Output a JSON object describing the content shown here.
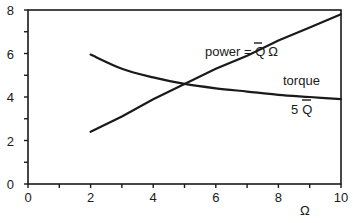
{
  "chart_data": {
    "type": "line",
    "title": "",
    "xlabel": "Ω",
    "ylabel": "",
    "xlim": [
      0,
      10
    ],
    "ylim": [
      0,
      8
    ],
    "grid": false,
    "legend": "none (inline annotations)",
    "x_ticks": [
      "0",
      "2",
      "4",
      "6",
      "8",
      "10"
    ],
    "y_ticks": [
      "0",
      "2",
      "4",
      "6",
      "8"
    ],
    "series": [
      {
        "name": "power = Q̄ Ω",
        "x": [
          2,
          3,
          4,
          5,
          6,
          7,
          8,
          9,
          10
        ],
        "values": [
          2.4,
          3.1,
          3.9,
          4.6,
          5.3,
          5.9,
          6.6,
          7.2,
          7.8
        ]
      },
      {
        "name": "torque 5 Q̄",
        "x": [
          2,
          3,
          4,
          5,
          6,
          7,
          8,
          9,
          10
        ],
        "values": [
          5.95,
          5.3,
          4.9,
          4.6,
          4.4,
          4.25,
          4.1,
          4.0,
          3.9
        ]
      }
    ],
    "annotations": [
      {
        "text": "power = Q̄ Ω",
        "x": 5.8,
        "y": 6.0
      },
      {
        "text": "torque",
        "x": 8.5,
        "y": 4.5
      },
      {
        "text": "5 Q̄",
        "x": 8.5,
        "y": 3.4
      }
    ]
  },
  "labels": {
    "power_prefix": "power = ",
    "power_q": "Q",
    "power_omega": "Ω",
    "torque": "torque",
    "torque_five": "5",
    "torque_q": "Q",
    "x_axis": "Ω"
  }
}
